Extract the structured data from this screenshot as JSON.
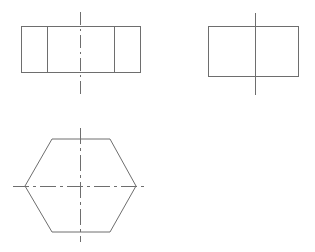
{
  "canvas": {
    "width": 315,
    "height": 252,
    "background": "#ffffff",
    "line_color": "#6e6e6e",
    "line_width": 1
  },
  "drawing": {
    "title": "Three-view orthographic projection of a hexagonal prism",
    "projection": "third-angle orthographic",
    "views": [
      {
        "id": "front-view",
        "name": "Front View",
        "shape": "rectangle",
        "note": "Rectangle with two interior vertical division lines representing hexagon prism flats",
        "rect": {
          "x": 21,
          "y": 26,
          "width": 119,
          "height": 46
        },
        "dividers": [
          {
            "orientation": "vertical",
            "x": 47,
            "y1": 26,
            "y2": 72
          },
          {
            "orientation": "vertical",
            "x": 114,
            "y1": 26,
            "y2": 72
          }
        ],
        "centerlines": [
          {
            "id": "front-vertical-centerline",
            "orientation": "vertical",
            "style": "dash-dot",
            "x": 80,
            "y1": 12,
            "y2": 95
          }
        ]
      },
      {
        "id": "side-view",
        "name": "Side View",
        "shape": "rectangle",
        "note": "Plain rectangle with solid vertical centerline",
        "rect": {
          "x": 208,
          "y": 26,
          "width": 90,
          "height": 50
        },
        "dividers": [],
        "centerlines": [
          {
            "id": "side-vertical-centerline",
            "orientation": "vertical",
            "style": "solid",
            "x": 255,
            "y1": 13,
            "y2": 95
          }
        ]
      },
      {
        "id": "top-view",
        "name": "Top View",
        "shape": "hexagon",
        "note": "Regular hexagon, flat top and bottom, points left and right",
        "vertices": [
          {
            "x": 52,
            "y": 139
          },
          {
            "x": 110,
            "y": 139
          },
          {
            "x": 136,
            "y": 186
          },
          {
            "x": 110,
            "y": 232
          },
          {
            "x": 52,
            "y": 232
          },
          {
            "x": 25,
            "y": 186
          }
        ],
        "centerlines": [
          {
            "id": "top-vertical-centerline",
            "orientation": "vertical",
            "style": "dash-dot",
            "x": 80,
            "y1": 128,
            "y2": 242
          },
          {
            "id": "top-horizontal-centerline",
            "orientation": "horizontal",
            "style": "dash-dot",
            "y": 186,
            "x1": 13,
            "x2": 148
          }
        ]
      }
    ]
  }
}
